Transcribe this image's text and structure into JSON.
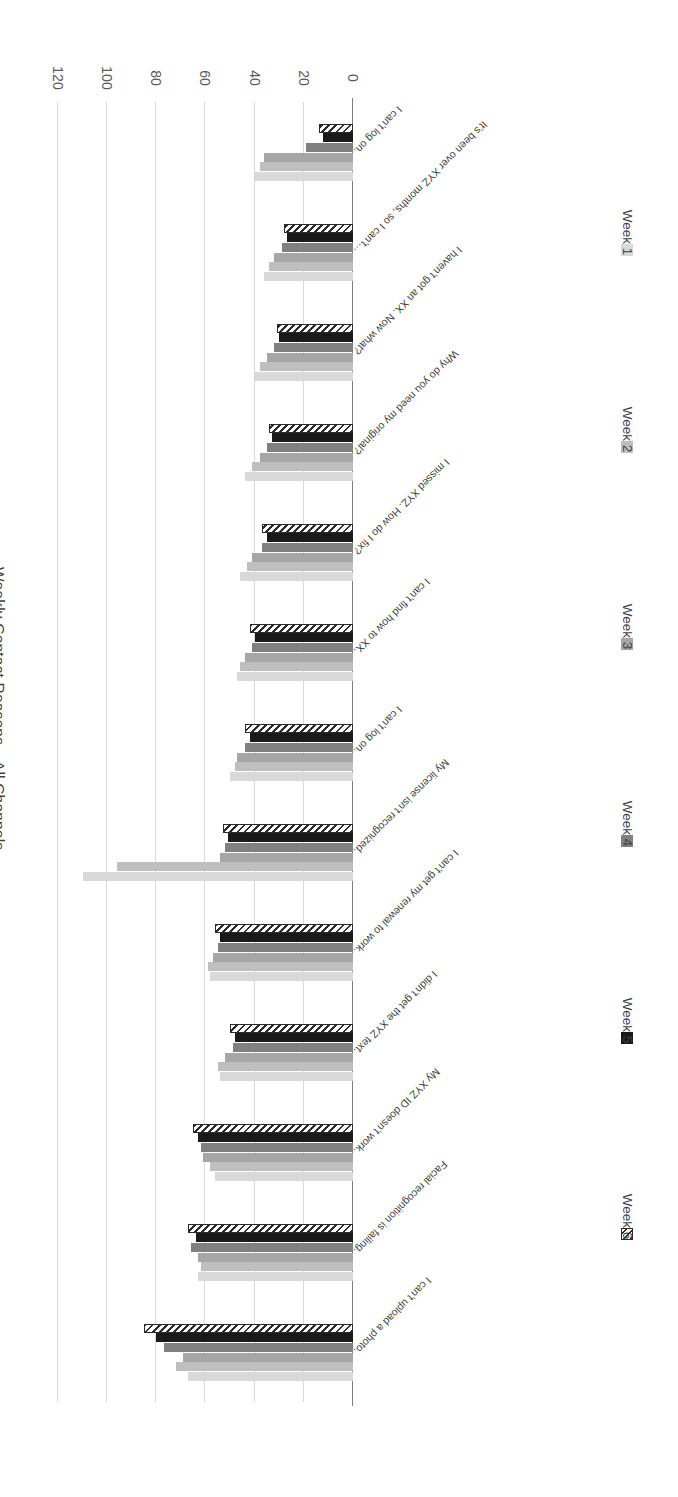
{
  "chart_data": {
    "type": "bar",
    "orientation": "horizontal",
    "title": "Weekly Contact Reasons—All Channels",
    "xlabel": "",
    "ylabel": "",
    "xlim": [
      0,
      120
    ],
    "xticks": [
      0,
      20,
      40,
      60,
      80,
      100,
      120
    ],
    "grid": true,
    "legend_position": "bottom",
    "categories": [
      "I can’t upload a photo.",
      "Facial recognition is failing.",
      "My XYZ ID doesn’t work.",
      "I didn’t get the XYZ text.",
      "I can’t get my renewal to work.",
      "My license isn’t recognized.",
      "I can’t log on.",
      "I can’t find how to XX.",
      "I missed XYZ. How do I fix?",
      "Why do you need my original?",
      "I haven’t got an XX. Now what?",
      "It’s been over XYZ months, so I can’t…",
      "I can’t log on."
    ],
    "series": [
      {
        "name": "Week 1",
        "color": "#d9d9d9",
        "values": [
          67,
          63,
          56,
          54,
          58,
          110,
          50,
          47,
          46,
          44,
          40,
          36,
          40
        ]
      },
      {
        "name": "Week 2",
        "color": "#bfbfbf",
        "values": [
          72,
          62,
          58,
          55,
          59,
          96,
          48,
          46,
          43,
          41,
          38,
          34,
          38
        ]
      },
      {
        "name": "Week 3",
        "color": "#a6a6a6",
        "values": [
          69,
          63,
          61,
          52,
          57,
          54,
          47,
          44,
          41,
          38,
          35,
          32,
          36
        ]
      },
      {
        "name": "Week 4",
        "color": "#808080",
        "values": [
          77,
          66,
          62,
          49,
          55,
          52,
          44,
          41,
          37,
          35,
          32,
          29,
          19
        ]
      },
      {
        "name": "Week 5",
        "color": "#1a1a1a",
        "values": [
          80,
          64,
          63,
          48,
          54,
          51,
          42,
          40,
          35,
          33,
          30,
          27,
          12
        ]
      },
      {
        "name": "Week 6",
        "color": "#ffffff",
        "hatched": true,
        "values": [
          85,
          67,
          65,
          50,
          56,
          53,
          44,
          42,
          37,
          34,
          31,
          28,
          14
        ]
      }
    ]
  },
  "legend": {
    "items": [
      {
        "label": "Week 1"
      },
      {
        "label": "Week 2"
      },
      {
        "label": "Week 3"
      },
      {
        "label": "Week 4"
      },
      {
        "label": "Week 5"
      },
      {
        "label": "Week 6"
      }
    ]
  },
  "axis": {
    "tick_labels": [
      "0",
      "20",
      "40",
      "60",
      "80",
      "100",
      "120"
    ]
  }
}
